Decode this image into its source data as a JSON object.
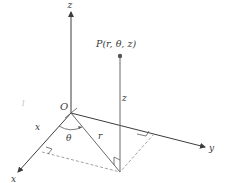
{
  "diagram": {
    "labels": {
      "z_axis": "z",
      "y_axis": "y",
      "x_axis": "x",
      "origin": "O",
      "point": "P(r, θ, z)",
      "angle": "θ",
      "radius": "r",
      "height": "z",
      "x_segment": "x",
      "stray_mark": "l"
    },
    "colors": {
      "axis": "#3c3c3c",
      "line": "#6a6a6a",
      "dashed": "#8a8a8a",
      "text": "#3a3a3a",
      "background": "#ffffff"
    }
  }
}
